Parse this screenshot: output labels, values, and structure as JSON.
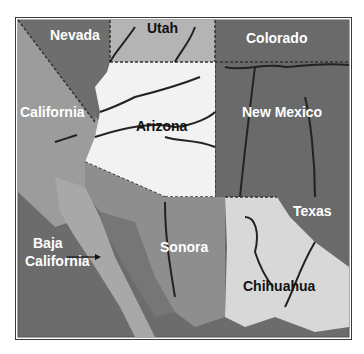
{
  "map": {
    "title": "Southwestern US and Northwestern Mexico",
    "colors": {
      "background": "#ffffff",
      "frame": "#3a3a3a",
      "nevada": "#6e6e6e",
      "utah": "#b4b4b4",
      "colorado": "#6a6a6a",
      "california": "#9c9c9c",
      "arizona": "#f2f2f2",
      "new_mexico": "#6a6a6a",
      "texas": "#6a6a6a",
      "sonora": "#8e8e8e",
      "sonora_coast": "#767676",
      "baja_california": "#a8a8a8",
      "ocean": "#6c6c6c",
      "chihuahua": "#d8d8d8",
      "river": "#222222"
    },
    "labels": {
      "nevada": "Nevada",
      "utah": "Utah",
      "colorado": "Colorado",
      "california": "California",
      "arizona": "Arizona",
      "new_mexico": "New Mexico",
      "texas": "Texas",
      "baja_line1": "Baja",
      "baja_line2": "California",
      "sonora": "Sonora",
      "chihuahua": "Chihuahua"
    }
  }
}
